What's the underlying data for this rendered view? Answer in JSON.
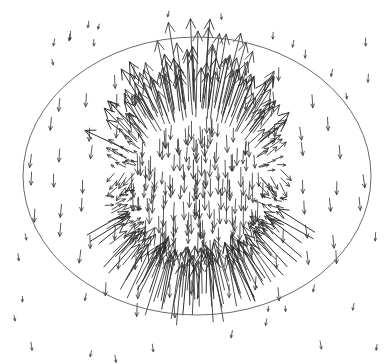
{
  "figure": {
    "type": "vector-field-plot",
    "width": 391,
    "height": 364,
    "background_color": "#ffffff"
  },
  "chart_data": {
    "type": "scatter",
    "title": "",
    "subtitle": "",
    "xlabel": "",
    "ylabel": "",
    "grid": false,
    "legend": "none",
    "axes_visible": false,
    "tick_labels": [],
    "annotations": [],
    "xlim": [
      0,
      391
    ],
    "ylim": [
      0,
      364
    ],
    "elements": {
      "boundary": {
        "shape": "ellipse",
        "cx": 197,
        "cy": 176,
        "rx": 174,
        "ry": 139,
        "stroke": "#5a5a5a",
        "stroke_width": 0.9,
        "fill": "none"
      },
      "sphere": {
        "shape": "circle-implied",
        "cx": 197,
        "cy": 180,
        "r": 80,
        "visible_outline": false
      }
    },
    "field_model": {
      "name": "dipole-like axial field",
      "axis": "vertical",
      "top_pole": {
        "x": 197,
        "y": 100,
        "behavior": "outflow",
        "max_arrow_length": 62
      },
      "bottom_pole": {
        "x": 197,
        "y": 260,
        "behavior": "inflow",
        "max_arrow_length": 62
      },
      "interior_uniform_direction_deg": 90,
      "interior_arrow_length": 17,
      "farfield_arrow_length": 7,
      "farfield_direction_deg": 90
    },
    "arrow_style": {
      "color": "#2e2e2e",
      "shaft_width": 0.8,
      "head_angle_deg": 26,
      "head_length_ratio": 0.32
    },
    "sample_counts": {
      "interior_rings": 7,
      "surface_arrows": 210,
      "exterior_arrows": 88,
      "outside_ellipse_arrows": 34,
      "total_approx": 360
    },
    "series": [
      {
        "name": "interior field",
        "region": "inside sphere",
        "direction_deg": 90,
        "typical_length": 17,
        "count": 46
      },
      {
        "name": "surface flux",
        "region": "sphere shell",
        "direction_deg": "radial",
        "typical_length": 34,
        "count": 210
      },
      {
        "name": "near field",
        "region": "between sphere and ellipse",
        "direction_deg": 90,
        "typical_length": 11,
        "count": 88
      },
      {
        "name": "far field",
        "region": "outside ellipse",
        "direction_deg": 90,
        "typical_length": 6,
        "count": 34
      }
    ]
  }
}
